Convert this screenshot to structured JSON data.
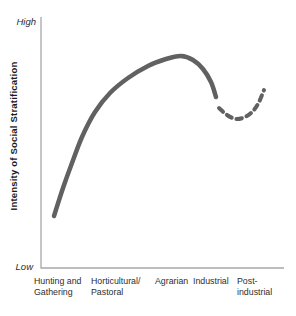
{
  "chart": {
    "y_axis": {
      "title": "Intensity of Social Stratification",
      "top_label": "High",
      "bottom_label": "Low"
    },
    "x_axis": {
      "categories_lines": [
        [
          "Hunting and",
          "Gathering"
        ],
        [
          "Horticultural/",
          "Pastoral"
        ],
        [
          "Agrarian"
        ],
        [
          "Industrial"
        ],
        [
          "Post-",
          "industrial"
        ]
      ]
    }
  },
  "chart_data": {
    "type": "line",
    "title": "",
    "ylabel": "Intensity of Social Stratification",
    "xlabel": "",
    "y_range_labels": {
      "top": "High",
      "bottom": "Low"
    },
    "y_axis_numeric": false,
    "grid": false,
    "legend": null,
    "categories": [
      "Hunting and Gathering",
      "Horticultural/Pastoral",
      "Agrarian",
      "Industrial",
      "Post-industrial"
    ],
    "series": [
      {
        "name": "observed",
        "line_style": "solid",
        "points_px": [
          [
            54,
            216
          ],
          [
            63,
            188
          ],
          [
            72,
            163
          ],
          [
            82,
            137
          ],
          [
            95,
            112
          ],
          [
            110,
            93
          ],
          [
            128,
            78
          ],
          [
            148,
            66
          ],
          [
            166,
            59
          ],
          [
            181,
            56
          ],
          [
            193,
            60
          ],
          [
            203,
            69
          ],
          [
            211,
            82
          ],
          [
            216,
            97
          ]
        ],
        "intensity_normalized": [
          0.21,
          0.32,
          0.42,
          0.52,
          0.62,
          0.7,
          0.76,
          0.8,
          0.83,
          0.85,
          0.83,
          0.79,
          0.74,
          0.68
        ]
      },
      {
        "name": "projected",
        "line_style": "dashed",
        "points_px": [
          [
            219,
            108
          ],
          [
            227,
            115
          ],
          [
            236,
            119
          ],
          [
            245,
            117
          ],
          [
            253,
            111
          ],
          [
            259,
            102
          ],
          [
            264,
            90
          ]
        ],
        "intensity_normalized": [
          0.64,
          0.61,
          0.59,
          0.6,
          0.63,
          0.66,
          0.71
        ]
      }
    ],
    "plot_area_px": {
      "left": 41,
      "top": 17,
      "right": 284,
      "bottom": 268
    },
    "line_color": "#616161",
    "axis_color": "#a8a8a8"
  }
}
